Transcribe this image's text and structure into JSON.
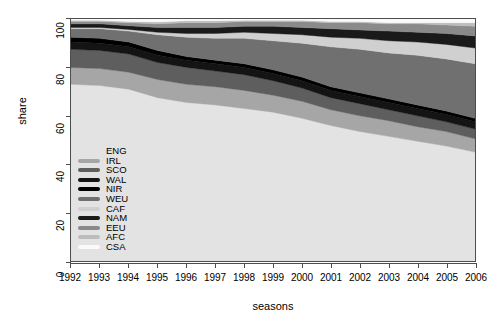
{
  "chart_data": {
    "type": "area",
    "stacked": true,
    "title": "",
    "xlabel": "seasons",
    "ylabel": "share",
    "xlim": [
      1992,
      2006
    ],
    "ylim": [
      0,
      100
    ],
    "grid": false,
    "legend_position": "inside-left-middle",
    "x": [
      1992,
      1993,
      1994,
      1995,
      1996,
      1997,
      1998,
      1999,
      2000,
      2001,
      2002,
      2003,
      2004,
      2005,
      2006
    ],
    "xtick_labels": [
      "1992",
      "1993",
      "1994",
      "1995",
      "1996",
      "1997",
      "1998",
      "1999",
      "2000",
      "2001",
      "2002",
      "2003",
      "2004",
      "2005",
      "2006"
    ],
    "ytick_labels": [
      "0",
      "20",
      "40",
      "60",
      "80",
      "100"
    ],
    "ytick_values": [
      0,
      20,
      40,
      60,
      80,
      100
    ],
    "series": [
      {
        "name": "ENG",
        "color": "#e3e3e3",
        "values": [
          73.0,
          72.5,
          71.0,
          67.5,
          65.5,
          64.5,
          63.0,
          61.5,
          59.0,
          56.0,
          53.5,
          51.5,
          49.5,
          47.5,
          45.0
        ]
      },
      {
        "name": "IRL",
        "color": "#a6a6a6",
        "values": [
          7.0,
          7.0,
          7.0,
          7.5,
          7.5,
          7.5,
          7.5,
          7.0,
          7.0,
          6.5,
          6.5,
          6.5,
          6.0,
          6.0,
          5.5
        ]
      },
      {
        "name": "SCO",
        "color": "#5e5e5e",
        "values": [
          7.5,
          7.5,
          7.5,
          7.0,
          7.0,
          6.5,
          6.5,
          6.0,
          5.5,
          5.0,
          5.0,
          4.5,
          4.5,
          4.0,
          4.0
        ]
      },
      {
        "name": "WAL",
        "color": "#141414",
        "values": [
          3.0,
          3.0,
          3.0,
          3.0,
          3.0,
          3.0,
          3.0,
          3.0,
          3.0,
          3.0,
          3.0,
          3.0,
          3.0,
          3.0,
          3.0
        ]
      },
      {
        "name": "NIR",
        "color": "#000000",
        "values": [
          2.0,
          2.0,
          2.0,
          2.0,
          1.5,
          1.5,
          1.5,
          1.5,
          1.5,
          1.5,
          1.5,
          1.5,
          1.5,
          1.5,
          1.5
        ]
      },
      {
        "name": "WEU",
        "color": "#707070",
        "values": [
          3.5,
          4.0,
          4.5,
          6.5,
          8.0,
          9.0,
          10.5,
          12.0,
          14.0,
          16.5,
          18.0,
          19.0,
          20.5,
          21.5,
          22.5
        ]
      },
      {
        "name": "CAF",
        "color": "#d0d0d0",
        "values": [
          0.5,
          0.5,
          0.7,
          1.0,
          1.5,
          2.0,
          2.5,
          3.0,
          3.5,
          4.0,
          4.5,
          5.0,
          5.5,
          6.0,
          6.5
        ]
      },
      {
        "name": "NAM",
        "color": "#1a1a1a",
        "values": [
          1.5,
          1.5,
          1.5,
          2.0,
          2.5,
          2.5,
          2.5,
          3.0,
          3.0,
          3.5,
          3.5,
          4.0,
          4.0,
          4.5,
          5.0
        ]
      },
      {
        "name": "EEU",
        "color": "#8a8a8a",
        "values": [
          1.0,
          1.0,
          1.2,
          1.5,
          2.0,
          2.0,
          2.0,
          2.0,
          2.5,
          2.5,
          3.0,
          3.0,
          3.5,
          3.5,
          4.0
        ]
      },
      {
        "name": "AFC",
        "color": "#bdbdbd",
        "values": [
          0.5,
          0.5,
          0.6,
          0.8,
          0.8,
          0.8,
          0.5,
          0.5,
          0.5,
          0.5,
          0.5,
          0.5,
          0.5,
          1.0,
          1.5
        ]
      },
      {
        "name": "CSA",
        "color": "#fafafa",
        "values": [
          0.5,
          0.5,
          1.0,
          1.2,
          0.7,
          0.7,
          0.5,
          0.5,
          0.5,
          1.0,
          1.0,
          1.5,
          1.5,
          1.5,
          1.5
        ]
      }
    ]
  },
  "axes": {
    "ylabel": "share",
    "xlabel": "seasons"
  },
  "legend": {
    "items": [
      {
        "label": "ENG",
        "color": "#e3e3e3",
        "show_key": false
      },
      {
        "label": "IRL",
        "color": "#a6a6a6",
        "show_key": true
      },
      {
        "label": "SCO",
        "color": "#5e5e5e",
        "show_key": true
      },
      {
        "label": "WAL",
        "color": "#141414",
        "show_key": true
      },
      {
        "label": "NIR",
        "color": "#000000",
        "show_key": true
      },
      {
        "label": "WEU",
        "color": "#707070",
        "show_key": true
      },
      {
        "label": "CAF",
        "color": "#d0d0d0",
        "show_key": true
      },
      {
        "label": "NAM",
        "color": "#1a1a1a",
        "show_key": true
      },
      {
        "label": "EEU",
        "color": "#8a8a8a",
        "show_key": true
      },
      {
        "label": "AFC",
        "color": "#bdbdbd",
        "show_key": true
      },
      {
        "label": "CSA",
        "color": "#fafafa",
        "show_key": true
      }
    ]
  }
}
